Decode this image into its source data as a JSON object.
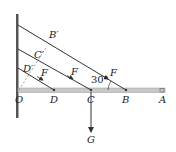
{
  "diagram": {
    "type": "statics-beam-with-ropes",
    "wall": {
      "label": ""
    },
    "beam": {
      "points": [
        "O",
        "D",
        "C",
        "B",
        "A"
      ]
    },
    "labels": {
      "O": "O",
      "D": "D",
      "C": "C",
      "B": "B",
      "A": "A",
      "B_prime": "B′",
      "C_prime": "C′",
      "D_prime": "D′",
      "force_D": "F",
      "force_C": "F",
      "force_B": "F",
      "weight": "G",
      "angle": "30°"
    },
    "colors": {
      "line": "#333333",
      "beam_fill": "#c8c8c8",
      "wall": "#555555",
      "dashed": "#888888"
    }
  }
}
